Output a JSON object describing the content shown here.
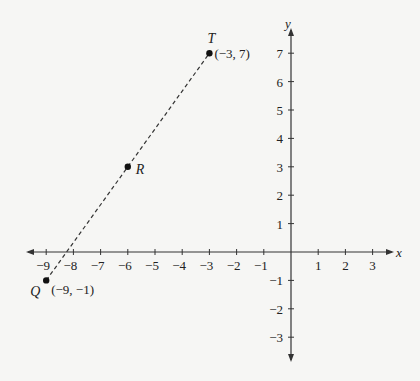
{
  "chart_data": {
    "type": "scatter",
    "title": "",
    "xlabel": "x",
    "ylabel": "y",
    "xlim": [
      -9.5,
      3.8
    ],
    "ylim": [
      -3.8,
      7.5
    ],
    "x_ticks": [
      -9,
      -8,
      -7,
      -6,
      -5,
      -4,
      -3,
      -2,
      -1,
      1,
      2,
      3
    ],
    "y_ticks": [
      -3,
      -2,
      -1,
      1,
      2,
      3,
      4,
      5,
      6,
      7
    ],
    "grid": false,
    "points": [
      {
        "name": "T",
        "x": -3,
        "y": 7,
        "label": "(−3, 7)"
      },
      {
        "name": "R",
        "x": -6,
        "y": 3,
        "label": ""
      },
      {
        "name": "Q",
        "x": -9,
        "y": -1,
        "label": "(−9, −1)"
      }
    ],
    "line": {
      "style": "dashed",
      "from": "Q",
      "to": "T"
    }
  }
}
